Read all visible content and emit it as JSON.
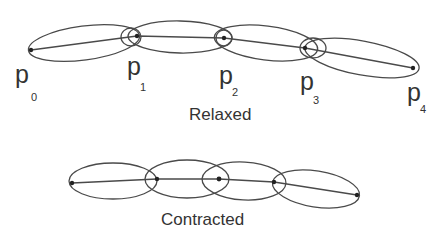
{
  "relaxed": {
    "caption": "Relaxed",
    "points": [
      {
        "label": "p",
        "sub": "0",
        "x": 31,
        "y": 50
      },
      {
        "label": "p",
        "sub": "1",
        "x": 137,
        "y": 36
      },
      {
        "label": "p",
        "sub": "2",
        "x": 224,
        "y": 38
      },
      {
        "label": "p",
        "sub": "3",
        "x": 305,
        "y": 48
      },
      {
        "label": "p",
        "sub": "4",
        "x": 413,
        "y": 68
      }
    ]
  },
  "contracted": {
    "caption": "Contracted",
    "points": [
      {
        "x": 72,
        "y": 183
      },
      {
        "x": 157,
        "y": 179
      },
      {
        "x": 219,
        "y": 179
      },
      {
        "x": 274,
        "y": 182
      },
      {
        "x": 357,
        "y": 195
      }
    ]
  },
  "colors": {
    "stroke": "#4a4a4a",
    "text": "#333333"
  }
}
